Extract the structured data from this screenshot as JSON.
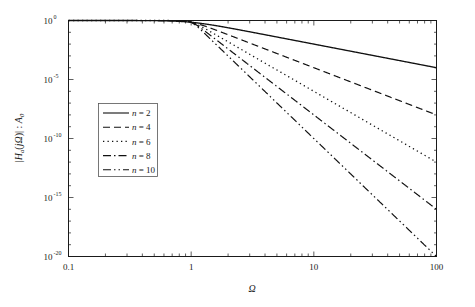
{
  "chart_data": {
    "type": "line",
    "title": "",
    "xlabel": "Ω",
    "ylabel": "|H_a(jΩ)| : A_0",
    "xscale": "log",
    "yscale": "log",
    "xlim": [
      0.1,
      100
    ],
    "ylim": [
      1e-20,
      1
    ],
    "grid": false,
    "legend_position": "center-left",
    "xticks": [
      "0.1",
      "1",
      "10",
      "100"
    ],
    "xtick_values": [
      0.1,
      1,
      10,
      100
    ],
    "yticks": [
      "10^0",
      "10^-5",
      "10^-10",
      "10^-15",
      "10^-20"
    ],
    "ytick_mantissa": [
      "10",
      "10",
      "10",
      "10",
      "10"
    ],
    "ytick_exponents": [
      "0",
      "-5",
      "-10",
      "-15",
      "-20"
    ],
    "ytick_values": [
      1,
      1e-05,
      1e-10,
      1e-15,
      1e-20
    ],
    "formula": "|Ha(jΩ)|/A0 = 1/sqrt(1 + Ω^(2n))",
    "series": [
      {
        "name": "n = 2",
        "n": 2,
        "dash": "solid",
        "points_x": [
          0.1,
          0.2,
          0.4,
          0.7,
          1.0,
          1.5,
          2.0,
          3.0,
          5.0,
          7.0,
          10.0,
          20.0,
          40.0,
          70.0,
          100.0
        ],
        "points_y": [
          1.0,
          0.9992,
          0.98765,
          0.89859,
          0.70711,
          0.4062,
          0.24254,
          0.11043,
          0.039968,
          0.020399,
          0.0099995,
          0.0025,
          0.000625,
          0.000204,
          0.0001
        ]
      },
      {
        "name": "n = 4",
        "n": 4,
        "dash": "dashed",
        "points_x": [
          0.1,
          0.4,
          0.7,
          1.0,
          1.5,
          2.0,
          3.0,
          5.0,
          7.0,
          10.0,
          20.0,
          40.0,
          70.0,
          100.0
        ],
        "points_y": [
          1.0,
          0.99987,
          0.97218,
          0.70711,
          0.19518,
          0.062378,
          0.012344,
          0.0016,
          0.000416,
          0.0001,
          6.25e-06,
          3.906e-07,
          4.165e-08,
          1e-08
        ]
      },
      {
        "name": "n = 6",
        "n": 6,
        "dash": "dotted",
        "points_x": [
          0.1,
          0.7,
          1.0,
          1.5,
          2.0,
          3.0,
          5.0,
          7.0,
          10.0,
          20.0,
          40.0,
          70.0,
          100.0
        ],
        "points_y": [
          1.0,
          0.99275,
          0.70711,
          0.08707,
          0.015617,
          0.0013717,
          6.4e-05,
          8.5e-06,
          1e-06,
          1.5625e-08,
          2.44e-10,
          8.5e-12,
          1e-12
        ]
      },
      {
        "name": "n = 8",
        "n": 8,
        "dash": "dashdot",
        "points_x": [
          0.1,
          0.7,
          1.0,
          1.5,
          2.0,
          3.0,
          5.0,
          7.0,
          10.0,
          20.0,
          40.0,
          70.0,
          100.0
        ],
        "points_y": [
          1.0,
          0.99856,
          0.70711,
          0.038978,
          0.0039062,
          0.00015242,
          2.56e-06,
          1.7347e-07,
          1e-08,
          3.906e-11,
          1.526e-13,
          1.735e-15,
          1e-16
        ]
      },
      {
        "name": "n = 10",
        "n": 10,
        "dash": "dashdotdot",
        "points_x": [
          0.1,
          0.7,
          1.0,
          1.5,
          2.0,
          3.0,
          5.0,
          7.0,
          10.0,
          20.0,
          40.0,
          60.0
        ],
        "points_y": [
          1.0,
          0.99972,
          0.70711,
          0.017342,
          0.00097656,
          1.6935e-05,
          1.024e-07,
          3.54e-09,
          1e-10,
          9.77e-14,
          9.5e-17,
          1e-18
        ]
      }
    ]
  },
  "axes": {
    "x_axis_label": "Ω",
    "y_axis_label_parts": {
      "bar_open": "|",
      "h": "H",
      "sub_a": "a",
      "paren_open": "(",
      "j": "j",
      "omega": "Ω",
      "paren_close": ")",
      "bar_close": "|",
      "colon": " : ",
      "a_cap": "A",
      "sub_zero": "0"
    },
    "y_axis_label_plain": "|Ha(jΩ)| : A0"
  },
  "legend": {
    "entries": [
      {
        "label_var": "n",
        "label_eq": "=",
        "label_val": "2",
        "style": "solid"
      },
      {
        "label_var": "n",
        "label_eq": "=",
        "label_val": "4",
        "style": "dashed"
      },
      {
        "label_var": "n",
        "label_eq": "=",
        "label_val": "6",
        "style": "dotted"
      },
      {
        "label_var": "n",
        "label_eq": "=",
        "label_val": "8",
        "style": "dashdot"
      },
      {
        "label_var": "n",
        "label_eq": "=",
        "label_val": "10",
        "style": "dashdotdot"
      }
    ]
  },
  "colors": {
    "line": "#111111",
    "axis": "#1a1a1a",
    "background": "#ffffff",
    "legend_border": "#555555"
  }
}
